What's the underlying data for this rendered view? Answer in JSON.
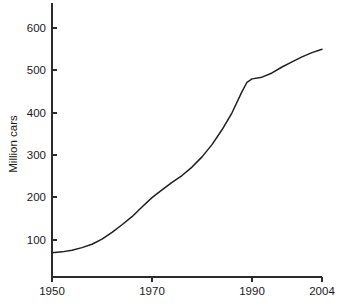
{
  "chart_data": {
    "type": "line",
    "title": "",
    "subtitle": "",
    "xlabel": "",
    "ylabel": "Million cars",
    "xlim": [
      1950,
      2004
    ],
    "ylim": [
      55,
      625
    ],
    "grid": false,
    "legend": "none",
    "annotations": [],
    "x_ticks": [
      1950,
      1970,
      1990,
      2004
    ],
    "x_tick_labels": [
      "1950",
      "1970",
      "1990",
      "2004"
    ],
    "y_ticks": [
      100,
      200,
      300,
      400,
      500,
      600
    ],
    "y_tick_labels": [
      "100",
      "200",
      "300",
      "400",
      "500",
      "600"
    ],
    "series": [
      {
        "name": "World car fleet",
        "x": [
          1950,
          1952,
          1954,
          1956,
          1958,
          1960,
          1962,
          1964,
          1966,
          1968,
          1970,
          1972,
          1974,
          1976,
          1978,
          1980,
          1982,
          1984,
          1986,
          1988,
          1989,
          1990,
          1992,
          1994,
          1996,
          1998,
          2000,
          2002,
          2004
        ],
        "values": [
          70,
          72,
          76,
          82,
          90,
          102,
          118,
          136,
          155,
          178,
          200,
          218,
          236,
          252,
          272,
          296,
          325,
          360,
          400,
          450,
          472,
          480,
          484,
          494,
          508,
          520,
          532,
          542,
          550
        ]
      }
    ]
  },
  "axis": {
    "y_label": "Million cars",
    "x_tick_1": "1950",
    "x_tick_2": "1970",
    "x_tick_3": "1990",
    "x_tick_4": "2004",
    "y_tick_1": "100",
    "y_tick_2": "200",
    "y_tick_3": "300",
    "y_tick_4": "400",
    "y_tick_5": "500",
    "y_tick_6": "600"
  },
  "colors": {
    "line": "#1f1f1f",
    "axis": "#2b2b2b",
    "background": "#ffffff"
  }
}
